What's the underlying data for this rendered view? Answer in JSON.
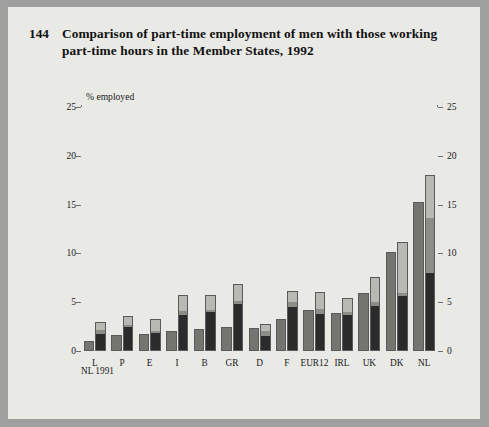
{
  "figure": {
    "number": "144",
    "title": "Comparison of part-time employment of men with those working part-time hours in the Member States, 1992"
  },
  "legend": {
    "items": [
      {
        "label": "Working 30-34 hrs",
        "color": "#b9b9b4",
        "key": "w30_34"
      },
      {
        "label": "Working <10 hrs",
        "color": "#8d8d88",
        "key": "w_lt10"
      },
      {
        "label": "Working 10-29 hrs",
        "color": "#2b2b2b",
        "key": "w10_29"
      },
      {
        "label": "Declared as part-time",
        "color": "#757570",
        "key": "declared"
      }
    ]
  },
  "footnote": "NL 1991",
  "chart_data": {
    "type": "bar",
    "subtype": "grouped-stacked",
    "title": "Comparison of part-time employment of men with those working part-time hours in the Member States, 1992",
    "ylabel": "% employed",
    "xlabel": "",
    "ylim": [
      0,
      25
    ],
    "yticks": [
      0,
      5,
      10,
      15,
      20,
      25
    ],
    "ytick_labels": [
      "0",
      "5",
      "10",
      "15",
      "20",
      "25"
    ],
    "grid": false,
    "legend_position": "upper-left-inside",
    "dual_axis": true,
    "categories": [
      "L",
      "P",
      "E",
      "I",
      "B",
      "GR",
      "D",
      "F",
      "EUR12",
      "IRL",
      "UK",
      "DK",
      "NL"
    ],
    "series": [
      {
        "name": "Declared as part-time",
        "color": "#757570",
        "values": [
          1.0,
          1.6,
          1.7,
          2.0,
          2.3,
          2.5,
          2.4,
          3.3,
          4.2,
          3.9,
          5.9,
          10.1,
          15.3
        ]
      },
      {
        "name": "Working 10-29 hrs",
        "color": "#2b2b2b",
        "values": [
          1.8,
          2.5,
          1.9,
          3.7,
          4.0,
          4.9,
          1.6,
          4.6,
          3.8,
          3.7,
          4.6,
          5.6,
          8.0
        ]
      },
      {
        "name": "Working <10 hrs",
        "color": "#8d8d88",
        "values": [
          0.4,
          0.2,
          0.2,
          0.4,
          0.3,
          0.3,
          0.5,
          0.5,
          0.6,
          0.4,
          0.5,
          0.4,
          5.7
        ]
      },
      {
        "name": "Working 30-34 hrs",
        "color": "#b9b9b4",
        "values": [
          0.8,
          0.9,
          1.2,
          1.6,
          1.4,
          1.7,
          0.7,
          1.1,
          1.6,
          1.3,
          2.5,
          5.2,
          4.3
        ]
      }
    ],
    "stack_totals": [
      3.0,
      3.6,
      3.3,
      5.7,
      5.7,
      6.9,
      2.8,
      6.2,
      6.0,
      5.4,
      7.6,
      11.2,
      18.0
    ]
  }
}
